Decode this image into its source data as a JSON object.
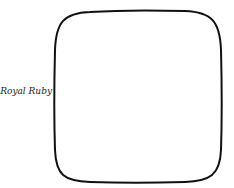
{
  "diagram": {
    "label": "Royal Ruby",
    "shape": "rounded-square",
    "stroke_color": "#111111",
    "fill_color": "#ffffff"
  }
}
